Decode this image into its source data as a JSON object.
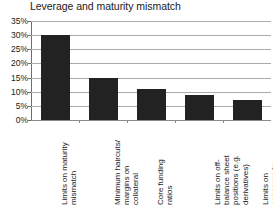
{
  "chart_data": {
    "type": "bar",
    "title": "Leverage and maturity mismatch",
    "xlabel": "",
    "ylabel": "",
    "ylim": [
      0,
      0.35
    ],
    "grid": true,
    "legend": "none",
    "ytick_labels": [
      "35%",
      "30%",
      "25%",
      "20%",
      "15%",
      "10%",
      "5%",
      "0%"
    ],
    "ytick_values": [
      0.35,
      0.3,
      0.25,
      0.2,
      0.15,
      0.1,
      0.05,
      0.0
    ],
    "categories": [
      "Limits on maturity mismatch",
      "Minimum haircuts/ margins on collateral",
      "Core funding ratios",
      "Limits on off-balance sheet positions (e.g. derivatives)",
      "Limits on exposure by instrument (e.g. CDS)"
    ],
    "category_lines": [
      [
        "Limits on maturity",
        "mismatch"
      ],
      [
        "Minimum haircuts/",
        "margins on",
        "collateral"
      ],
      [
        "Core funding",
        "ratios"
      ],
      [
        "Limits on off-",
        "balance sheet",
        "positions (e.g.",
        "derivatives)"
      ],
      [
        "Limits on",
        "exposure by",
        "instrument (e.g.",
        "CDS)"
      ]
    ],
    "values": [
      0.3,
      0.15,
      0.11,
      0.09,
      0.07
    ],
    "value_labels": [
      "30%",
      "15%",
      "11%",
      "9%",
      "7%"
    ],
    "bar_color": "#222222",
    "gridline_color": "#aaaaaa",
    "axis_color": "#6e6e6e"
  }
}
